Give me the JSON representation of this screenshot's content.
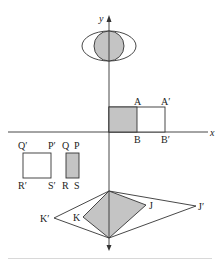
{
  "colors": {
    "stroke": "#333333",
    "fill_shaded": "#c4c4c4",
    "fill_blank": "#ffffff"
  },
  "axes": {
    "x_label": "x",
    "y_label": "y",
    "origin_px": [
      109,
      132
    ]
  },
  "figures": {
    "ellipse_circle": {
      "circle": {
        "cx": 109,
        "cy": 46,
        "r": 15,
        "shaded": true
      },
      "ellipse": {
        "cx": 109,
        "cy": 46,
        "rx": 27,
        "ry": 15,
        "shaded": false
      }
    },
    "rectangle_AB": {
      "original": {
        "x": 109,
        "y": 107,
        "w": 28,
        "h": 25,
        "shaded": true
      },
      "image": {
        "x": 109,
        "y": 107,
        "w": 56,
        "h": 25,
        "shaded": false
      },
      "labels": {
        "A": "A",
        "B": "B",
        "A_prime": "A′",
        "B_prime": "B′"
      }
    },
    "rectangle_PQRS": {
      "original": {
        "x": 66,
        "y": 153,
        "w": 13,
        "h": 25,
        "shaded": true
      },
      "image": {
        "x": 23,
        "y": 153,
        "w": 28,
        "h": 25,
        "shaded": false
      },
      "labels": {
        "P": "P",
        "Q": "Q",
        "R": "R",
        "S": "S",
        "P_prime": "P′",
        "Q_prime": "Q′",
        "R_prime": "R′",
        "S_prime": "S′"
      }
    },
    "kite_JK": {
      "top": [
        109,
        191
      ],
      "bottom": [
        109,
        238
      ],
      "J": [
        146,
        205
      ],
      "K": [
        83,
        217
      ],
      "J_prime": [
        196,
        206
      ],
      "K_prime": [
        54,
        218
      ],
      "labels": {
        "J": "J",
        "K": "K",
        "J_prime": "J′",
        "K_prime": "K′"
      }
    }
  }
}
